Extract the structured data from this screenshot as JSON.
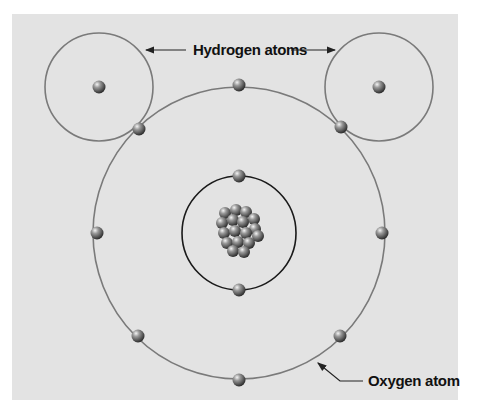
{
  "diagram": {
    "labels": {
      "hydrogen": "Hydrogen atoms",
      "oxygen": "Oxygen atom"
    },
    "colors": {
      "background": "#e3e3e3",
      "outer_orbit": "#7a7a7a",
      "inner_orbit": "#1a1a1a",
      "particle": "#6e6e6e",
      "label": "#111111"
    },
    "hydrogen_atoms": [
      {
        "center": [
          99,
          87
        ],
        "radius": 54
      },
      {
        "center": [
          379,
          87
        ],
        "radius": 54
      }
    ],
    "oxygen_atom": {
      "center": [
        239,
        233
      ],
      "outer_orbit_radius": 146,
      "inner_orbit_radius": 57,
      "outer_electrons": 8,
      "inner_electrons": 2
    }
  }
}
